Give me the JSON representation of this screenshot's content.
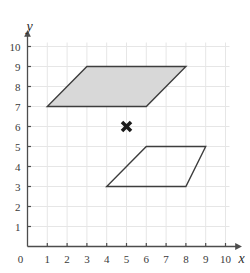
{
  "figure": {
    "title": "",
    "background_color": "#ffffff"
  },
  "chart_data": {
    "type": "scatter",
    "title": "",
    "xlabel": "x",
    "ylabel": "y",
    "xlim": [
      0,
      10
    ],
    "ylim": [
      0,
      10
    ],
    "grid": true,
    "grid_color": "#e6e6e6",
    "axis_color": "#4d4d4d",
    "x_ticks": [
      0,
      1,
      2,
      3,
      4,
      5,
      6,
      7,
      8,
      9,
      10
    ],
    "y_ticks": [
      0,
      1,
      2,
      3,
      4,
      5,
      6,
      7,
      8,
      9,
      10
    ],
    "x_tick_labels": [
      "0",
      "1",
      "2",
      "3",
      "4",
      "5",
      "6",
      "7",
      "8",
      "9",
      "10"
    ],
    "y_tick_labels": [
      "0",
      "1",
      "2",
      "3",
      "4",
      "5",
      "6",
      "7",
      "8",
      "9",
      "10"
    ],
    "legend": [],
    "annotations": [],
    "shapes": [
      {
        "name": "shaded-parallelogram",
        "type": "polygon",
        "points": [
          [
            1,
            7
          ],
          [
            6,
            7
          ],
          [
            8,
            9
          ],
          [
            3,
            9
          ]
        ],
        "fill": "#d8d8d8",
        "stroke": "#3d3d3d",
        "stroke_width": 1.4,
        "filled": true
      },
      {
        "name": "outline-parallelogram",
        "type": "polygon",
        "points": [
          [
            4,
            3
          ],
          [
            8,
            3
          ],
          [
            9,
            5
          ],
          [
            6,
            5
          ]
        ],
        "fill": "none",
        "stroke": "#3d3d3d",
        "stroke_width": 1.4,
        "filled": false
      }
    ],
    "points": [
      {
        "name": "center-of-rotation-marker",
        "x": 5,
        "y": 6,
        "marker": "x-bold",
        "color": "#1a1a1a",
        "size": 9
      }
    ]
  },
  "axes": {
    "x_axis_label": "x",
    "y_axis_label": "y",
    "origin_label": "0"
  }
}
